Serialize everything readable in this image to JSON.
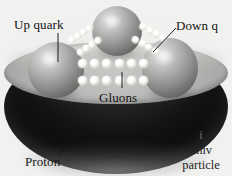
{
  "figure": {
    "background_color": "#f1f1f0",
    "ink_color": "#121212"
  },
  "labels": {
    "up_quark": "Up quark",
    "down_quark": "Down q",
    "gluons": "Gluons",
    "proton": "Proton"
  },
  "caption": {
    "line1": "i",
    "line2": "univ",
    "line3": "particle"
  },
  "parts": {
    "quark_up_left": "up-quark-sphere",
    "quark_top": "quark-sphere-top",
    "quark_down_right": "down-quark-sphere",
    "gluon_chain_horizontal": "gluon-bead-chain",
    "gluon_chain_left": "gluon-bead-chain",
    "gluon_chain_right": "gluon-bead-chain",
    "proton_body": "proton-bowl"
  },
  "colors": {
    "bowl_top": "#b5b5b3",
    "bowl_bottom": "#111111",
    "quark_sphere": "#8d8d8b",
    "gluon_bead": "#ffffff"
  }
}
